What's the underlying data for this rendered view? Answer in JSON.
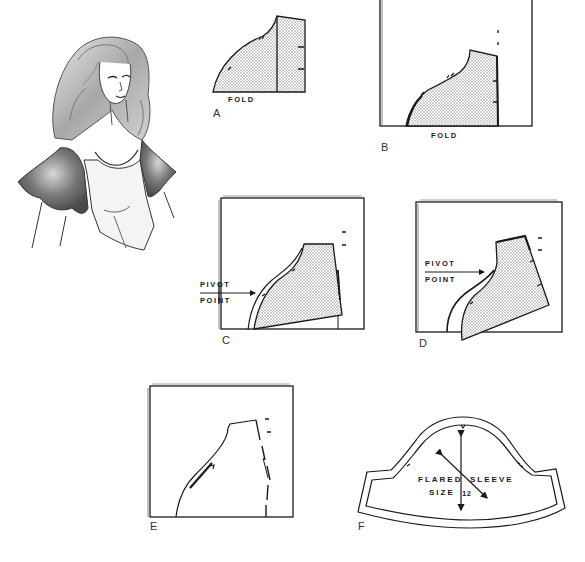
{
  "figure": {
    "illustration": "woman-wearing-flared-sleeve",
    "colors": {
      "line": "#1a1a1a",
      "fill_dots": "#9a9a9a",
      "paper": "#ffffff",
      "shading": "#6e6e6e"
    }
  },
  "steps": [
    {
      "id": "A",
      "label": "A",
      "captions": [
        "FOLD"
      ]
    },
    {
      "id": "B",
      "label": "B",
      "captions": [
        "FOLD"
      ]
    },
    {
      "id": "C",
      "label": "C",
      "captions": [
        "PIVOT",
        "POINT"
      ]
    },
    {
      "id": "D",
      "label": "D",
      "captions": [
        "PIVOT",
        "POINT"
      ]
    },
    {
      "id": "E",
      "label": "E",
      "captions": []
    },
    {
      "id": "F",
      "label": "F",
      "captions": [
        "FLARED",
        "SLEEVE",
        "SIZE",
        "12"
      ]
    }
  ]
}
